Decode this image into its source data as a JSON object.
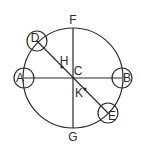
{
  "diagram": {
    "stroke_color": "#2b2b2b",
    "background": "#ffffff",
    "main_circle": {
      "center": "C",
      "cx": 73,
      "cy": 78,
      "r": 50
    },
    "points": {
      "A": {
        "label": "A",
        "x": 24,
        "y": 78
      },
      "B": {
        "label": "B",
        "x": 122,
        "y": 78
      },
      "C": {
        "label": "C",
        "x": 73,
        "y": 78
      },
      "D": {
        "label": "D",
        "x": 37,
        "y": 41
      },
      "E": {
        "label": "E",
        "x": 108,
        "y": 113
      },
      "F": {
        "label": "F",
        "x": 73,
        "y": 28
      },
      "G": {
        "label": "G",
        "x": 73,
        "y": 128
      },
      "H": {
        "label": "H",
        "x": 62,
        "y": 67
      },
      "K": {
        "label": "K",
        "x": 85,
        "y": 89
      }
    },
    "labels": {
      "A": {
        "text": "A",
        "x": 20,
        "y": 78
      },
      "B": {
        "text": "B",
        "x": 127,
        "y": 78
      },
      "C": {
        "text": "C",
        "x": 77,
        "y": 71
      },
      "D": {
        "text": "D",
        "x": 35,
        "y": 38
      },
      "E": {
        "text": "E",
        "x": 112,
        "y": 115
      },
      "F": {
        "text": "F",
        "x": 73,
        "y": 20
      },
      "G": {
        "text": "G",
        "x": 73,
        "y": 137
      },
      "H": {
        "text": "H",
        "x": 65,
        "y": 60
      },
      "K": {
        "text": "K",
        "x": 79,
        "y": 93
      }
    },
    "small_circles": [
      {
        "at": "A",
        "r": 10
      },
      {
        "at": "B",
        "r": 10
      },
      {
        "at": "D",
        "r": 10
      },
      {
        "at": "E",
        "r": 10
      }
    ],
    "segments": [
      {
        "from": "F",
        "to": "G"
      },
      {
        "from": "A",
        "to": "B"
      },
      {
        "from": "D",
        "to": "E"
      }
    ],
    "dots": [
      "H",
      "K"
    ]
  }
}
